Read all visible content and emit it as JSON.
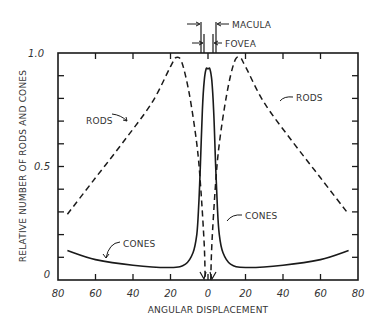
{
  "chart_data": {
    "type": "line",
    "title": "",
    "xlabel": "ANGULAR DISPLACEMENT",
    "ylabel": "RELATIVE NUMBER OF RODS AND CONES",
    "xlim": [
      -80,
      80
    ],
    "ylim": [
      0,
      1.0
    ],
    "x_tick_labels": [
      "80",
      "60",
      "40",
      "20",
      "0",
      "20",
      "40",
      "60",
      "80"
    ],
    "x_ticks": [
      -80,
      -60,
      -40,
      -20,
      0,
      20,
      40,
      60,
      80
    ],
    "y_tick_labels": [
      "0",
      "0.5",
      "1.0"
    ],
    "y_ticks": [
      0,
      0.5,
      1.0
    ],
    "y_minor_step": 0.1,
    "grid": false,
    "legend": null,
    "series": [
      {
        "name": "RODS",
        "style": "dashed",
        "x": [
          -75,
          -60,
          -45,
          -30,
          -20,
          -17,
          -14,
          -10,
          -6,
          -4,
          -2,
          -1.5,
          1.5,
          2,
          4,
          6,
          10,
          14,
          17,
          20,
          30,
          45,
          60,
          75
        ],
        "values": [
          0.29,
          0.45,
          0.61,
          0.78,
          0.94,
          0.98,
          0.96,
          0.82,
          0.6,
          0.42,
          0.15,
          0.0,
          0.0,
          0.15,
          0.42,
          0.6,
          0.82,
          0.96,
          0.98,
          0.94,
          0.78,
          0.61,
          0.45,
          0.29
        ]
      },
      {
        "name": "CONES",
        "style": "solid",
        "x": [
          -75,
          -60,
          -40,
          -20,
          -12,
          -8,
          -6,
          -5,
          -4,
          -3,
          -2,
          -1,
          0,
          1,
          2,
          3,
          4,
          5,
          6,
          8,
          12,
          20,
          40,
          60,
          75
        ],
        "values": [
          0.13,
          0.09,
          0.065,
          0.055,
          0.07,
          0.12,
          0.2,
          0.32,
          0.52,
          0.75,
          0.88,
          0.93,
          0.93,
          0.93,
          0.88,
          0.75,
          0.52,
          0.32,
          0.2,
          0.12,
          0.07,
          0.055,
          0.065,
          0.09,
          0.13
        ]
      }
    ],
    "annotations": [
      {
        "text": "RODS",
        "x": -55,
        "y": 0.75,
        "points_to": "left rods curve"
      },
      {
        "text": "RODS",
        "x": 52,
        "y": 0.75,
        "points_to": "right rods curve"
      },
      {
        "text": "CONES",
        "x": -45,
        "y": 0.15,
        "points_to": "left cones curve"
      },
      {
        "text": "CONES",
        "x": 15,
        "y": 0.28,
        "points_to": "right cones curve"
      },
      {
        "text": "MACULA",
        "x": 0,
        "y": 1.05,
        "span": [
          -3,
          3
        ]
      },
      {
        "text": "FOVEA",
        "x": 0,
        "y": 1.02,
        "span": [
          -1,
          1
        ]
      }
    ]
  },
  "labels": {
    "xlabel": "ANGULAR DISPLACEMENT",
    "ylabel": "RELATIVE NUMBER OF RODS AND CONES",
    "y_top": "1.0",
    "y_mid": "0.5",
    "y_bottom": "0",
    "rods_left": "RODS",
    "rods_right": "RODS",
    "cones_left": "CONES",
    "cones_right": "CONES",
    "macula": "MACULA",
    "fovea": "FOVEA"
  },
  "colors": {
    "ink": "#1a1a1a",
    "text": "#333333",
    "background": "#ffffff"
  }
}
